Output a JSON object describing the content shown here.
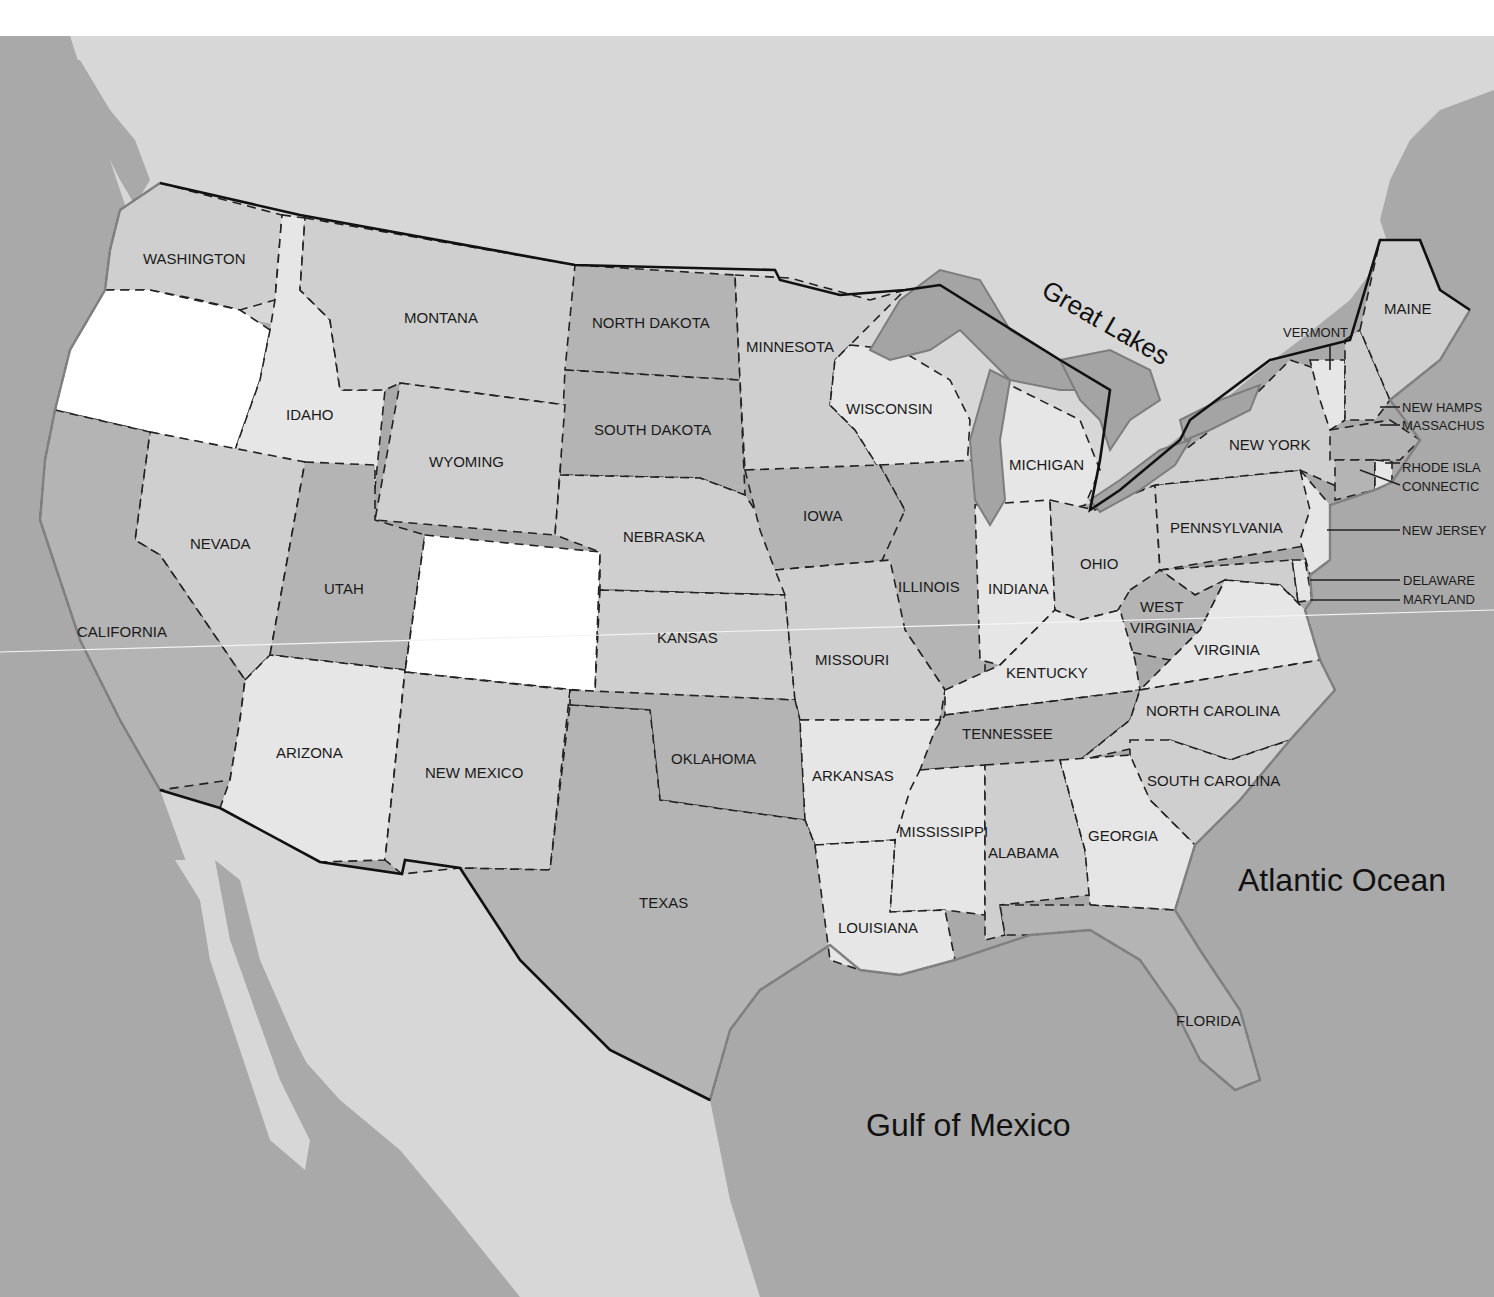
{
  "map": {
    "water_labels": {
      "great_lakes": "Great Lakes",
      "atlantic": "Atlantic Ocean",
      "gulf": "Gulf of Mexico"
    },
    "states": {
      "washington": "WASHINGTON",
      "oregon": "",
      "idaho": "IDAHO",
      "montana": "MONTANA",
      "north_dakota": "NORTH DAKOTA",
      "south_dakota": "SOUTH DAKOTA",
      "minnesota": "MINNESOTA",
      "wisconsin": "WISCONSIN",
      "michigan": "MICHIGAN",
      "wyoming": "WYOMING",
      "nevada": "NEVADA",
      "california": "CALIFORNIA",
      "utah": "UTAH",
      "colorado": "",
      "nebraska": "NEBRASKA",
      "iowa": "IOWA",
      "illinois": "ILLINOIS",
      "indiana": "INDIANA",
      "ohio": "OHIO",
      "pennsylvania": "PENNSYLVANIA",
      "new_york": "NEW YORK",
      "vermont": "VERMONT",
      "maine": "MAINE",
      "new_hampshire": "NEW HAMPS",
      "massachusetts": "MASSACHUS",
      "rhode_island": "RHODE ISLA",
      "connecticut": "CONNECTIC",
      "new_jersey": "NEW JERSEY",
      "delaware": "DELAWARE",
      "maryland": "MARYLAND",
      "west_virginia_1": "WEST",
      "west_virginia_2": "VIRGINIA",
      "virginia": "VIRGINIA",
      "kansas": "KANSAS",
      "missouri": "MISSOURI",
      "kentucky": "KENTUCKY",
      "arizona": "ARIZONA",
      "new_mexico": "NEW MEXICO",
      "oklahoma": "OKLAHOMA",
      "arkansas": "ARKANSAS",
      "tennessee": "TENNESSEE",
      "north_carolina": "NORTH CAROLINA",
      "south_carolina": "SOUTH CAROLINA",
      "mississippi": "MISSISSIPPI",
      "alabama": "ALABAMA",
      "georgia": "GEORGIA",
      "texas": "TEXAS",
      "louisiana": "LOUISIANA",
      "florida": "FLORIDA"
    },
    "colors": {
      "ocean": "#a9a9a9",
      "foreign_land": "#d7d7d7",
      "highlight_white": "#ffffff",
      "light": "#e6e6e6",
      "mid": "#cfcfcf",
      "dark": "#b4b4b4"
    }
  }
}
